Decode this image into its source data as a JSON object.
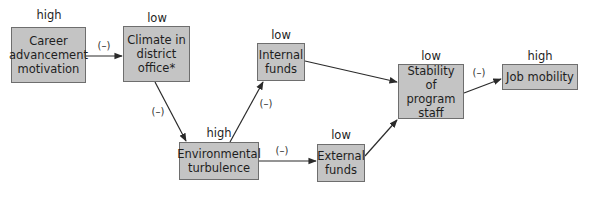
{
  "diagram": {
    "nodes": [
      {
        "id": "career",
        "label": "Career advancement motivation",
        "lines": [
          "Career",
          "advancement",
          "motivation"
        ],
        "level": "high"
      },
      {
        "id": "climate",
        "label": "Climate in district office*",
        "lines": [
          "Climate in",
          "district",
          "office*"
        ],
        "level": "low"
      },
      {
        "id": "internal",
        "label": "Internal funds",
        "lines": [
          "Internal",
          "funds"
        ],
        "level": "low"
      },
      {
        "id": "environmental",
        "label": "Environmental turbulence",
        "lines": [
          "Environmental",
          "turbulence"
        ],
        "level": "high"
      },
      {
        "id": "external",
        "label": "External funds",
        "lines": [
          "External",
          "funds"
        ],
        "level": "low"
      },
      {
        "id": "stability",
        "label": "Stability of program staff",
        "lines": [
          "Stability",
          "of program",
          "staff"
        ],
        "level": "low"
      },
      {
        "id": "job",
        "label": "Job mobility",
        "lines": [
          "Job mobility"
        ],
        "level": "high"
      }
    ],
    "edges": [
      {
        "from": "career",
        "to": "climate",
        "sign": "(–)"
      },
      {
        "from": "climate",
        "to": "environmental",
        "sign": "(–)"
      },
      {
        "from": "environmental",
        "to": "internal",
        "sign": "(–)"
      },
      {
        "from": "environmental",
        "to": "external",
        "sign": "(–)"
      },
      {
        "from": "internal",
        "to": "stability",
        "sign": ""
      },
      {
        "from": "external",
        "to": "stability",
        "sign": ""
      },
      {
        "from": "stability",
        "to": "job",
        "sign": "(–)"
      }
    ]
  },
  "colors": {
    "node_fill": "#c4c4c4",
    "node_border": "#6e6e6e",
    "edge": "#2a2a2a"
  }
}
